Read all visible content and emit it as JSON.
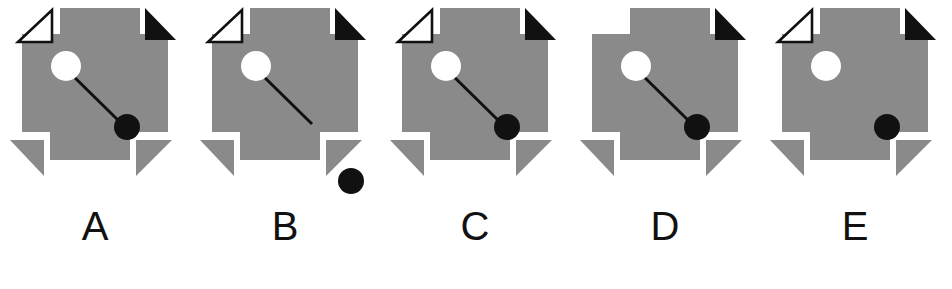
{
  "puzzle": {
    "type": "figure-comparison",
    "figure_count": 5,
    "colors": {
      "body_gray": "#8a8a8a",
      "black": "#111111",
      "white": "#ffffff",
      "background": "#ffffff",
      "label": "#111111"
    },
    "figures": [
      {
        "id": "A",
        "label": "A",
        "shape": "gray-cross-octagon",
        "corner_top_left": "white-outline-triangle",
        "corner_top_right": "black-filled-triangle",
        "corner_bottom_left": "gray-triangle-notch",
        "corner_bottom_right": "gray-triangle-notch",
        "white_circle": "present",
        "black_circle": "present-inside",
        "connector_line": "present-connects-both-circles",
        "description": "Complete figure: white circle linked by diagonal line to black circle inside the gray body."
      },
      {
        "id": "B",
        "label": "B",
        "shape": "gray-cross-octagon",
        "corner_top_left": "white-outline-triangle",
        "corner_top_right": "black-filled-triangle",
        "corner_bottom_left": "gray-triangle-notch",
        "corner_bottom_right": "gray-triangle-notch",
        "white_circle": "present",
        "black_circle": "present-detached-outside",
        "connector_line": "present-unattached-end",
        "description": "Line ends bare; black circle detached outside the gray body at lower right."
      },
      {
        "id": "C",
        "label": "C",
        "shape": "gray-cross-octagon",
        "corner_top_left": "white-outline-triangle",
        "corner_top_right": "black-filled-triangle",
        "corner_bottom_left": "gray-triangle-notch",
        "corner_bottom_right": "gray-triangle-notch",
        "white_circle": "present",
        "black_circle": "present-inside",
        "connector_line": "present-connects-both-circles",
        "description": "Complete figure: white circle linked by diagonal line to black circle inside the gray body."
      },
      {
        "id": "D",
        "label": "D",
        "shape": "gray-cross-octagon",
        "corner_top_left": "missing",
        "corner_top_right": "black-filled-triangle",
        "corner_bottom_left": "gray-triangle-notch",
        "corner_bottom_right": "gray-triangle-notch",
        "white_circle": "present",
        "black_circle": "present-inside",
        "connector_line": "present-connects-both-circles",
        "description": "Missing the white outline triangle at the top-left corner."
      },
      {
        "id": "E",
        "label": "E",
        "shape": "gray-cross-octagon",
        "corner_top_left": "white-outline-triangle",
        "corner_top_right": "black-filled-triangle",
        "corner_bottom_left": "gray-triangle-notch",
        "corner_bottom_right": "gray-triangle-notch",
        "white_circle": "present",
        "black_circle": "present-inside",
        "connector_line": "absent",
        "description": "No connecting line between the white and black circles."
      }
    ]
  }
}
